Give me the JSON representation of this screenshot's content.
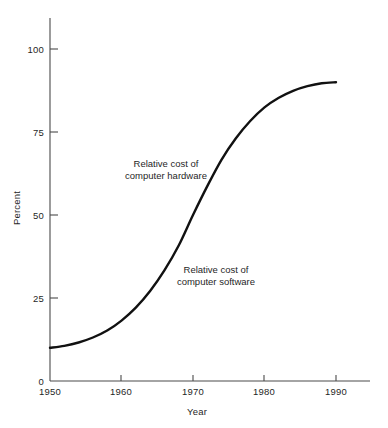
{
  "chart_data": {
    "type": "line",
    "title": "",
    "xlabel": "Year",
    "ylabel": "Percent",
    "xlim": [
      1950,
      1990
    ],
    "ylim": [
      0,
      100
    ],
    "grid": false,
    "legend_position": "inline-annotation",
    "x_ticks": [
      1950,
      1960,
      1970,
      1980,
      1990
    ],
    "x_tick_labels": [
      "1950",
      "1960",
      "1970",
      "1980",
      "1990"
    ],
    "y_ticks": [
      0,
      25,
      50,
      75,
      100
    ],
    "y_tick_labels": [
      "0",
      "25",
      "50",
      "75",
      "100"
    ],
    "series": [
      {
        "name": "Relative cost of computer software",
        "color": "#111111",
        "x": [
          1950,
          1952,
          1954,
          1956,
          1958,
          1960,
          1962,
          1964,
          1966,
          1968,
          1970,
          1972,
          1974,
          1976,
          1978,
          1980,
          1982,
          1984,
          1986,
          1988,
          1990
        ],
        "values": [
          10,
          10.6,
          11.6,
          13.1,
          15.2,
          18.2,
          22.1,
          27.1,
          33.3,
          40.8,
          50.0,
          58.7,
          66.7,
          73.1,
          78.3,
          82.4,
          85.3,
          87.4,
          88.8,
          89.7,
          90.0
        ]
      }
    ],
    "annotations": [
      {
        "id": "hardware-annotation",
        "lines": [
          "Relative cost of",
          "computer hardware"
        ],
        "x_anchor": 1971,
        "y_anchor": 64,
        "region": "above-left-of-curve",
        "note": "Region above the curve represents relative cost of computer hardware"
      },
      {
        "id": "software-annotation",
        "lines": [
          "Relative cost of",
          "computer software"
        ],
        "x_anchor": 1974,
        "y_anchor": 34,
        "region": "below-right-of-curve",
        "note": "Region below the curve represents relative cost of computer software"
      }
    ]
  },
  "axes": {
    "y_title": "Percent",
    "x_title": "Year"
  },
  "style": {
    "curve_color": "#111111",
    "axis_color": "#4a4a4a",
    "text_color": "#1f1f1f",
    "background": "#ffffff"
  }
}
